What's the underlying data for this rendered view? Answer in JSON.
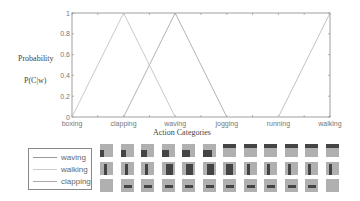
{
  "chart_data": {
    "type": "line",
    "title": "",
    "xlabel": "Action Categories",
    "ylabel": [
      "Probability",
      "P(C|w)"
    ],
    "categories": [
      "boxing",
      "clapping",
      "waving",
      "jogging",
      "running",
      "walking"
    ],
    "ylim": [
      0,
      1
    ],
    "yticks": [
      "0",
      "0.2",
      "0.4",
      "0.6",
      "0.8",
      "1"
    ],
    "grid": false,
    "series": [
      {
        "name": "waving",
        "values": [
          0,
          0,
          1,
          0,
          0,
          0
        ]
      },
      {
        "name": "walking",
        "values": [
          0,
          0,
          0,
          0,
          0,
          1
        ]
      },
      {
        "name": "clapping",
        "values": [
          0,
          1,
          0,
          0,
          0,
          0
        ]
      }
    ],
    "legend_position": "bottom-left"
  },
  "legend": {
    "items": [
      "waving",
      "walking",
      "clapping"
    ]
  },
  "thumbnails": {
    "rows": 3,
    "cols": 12
  }
}
